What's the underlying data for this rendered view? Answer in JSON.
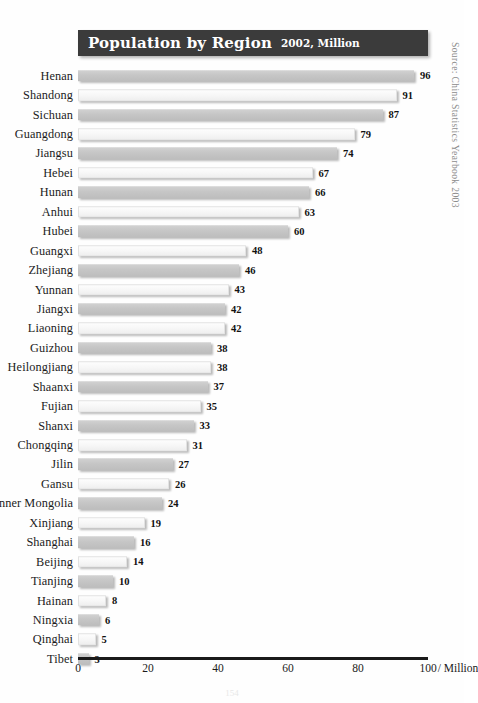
{
  "title": {
    "main": "Population by Region",
    "sub": "2002, Million"
  },
  "source_note": "Source: China Statistics Yearbook 2003",
  "page_number": "154",
  "axis": {
    "unit_label": "/ Million",
    "ticks": [
      "0",
      "20",
      "40",
      "60",
      "80",
      "100"
    ]
  },
  "chart_data": {
    "type": "bar",
    "orientation": "horizontal",
    "title": "Population by Region",
    "subtitle": "2002, Million",
    "xlabel": "/ Million",
    "ylabel": "",
    "xlim": [
      0,
      100
    ],
    "xticks": [
      0,
      20,
      40,
      60,
      80,
      100
    ],
    "grid": false,
    "legend": null,
    "source": "Source: China Statistics Yearbook 2003",
    "categories": [
      "Henan",
      "Shandong",
      "Sichuan",
      "Guangdong",
      "Jiangsu",
      "Hebei",
      "Hunan",
      "Anhui",
      "Hubei",
      "Guangxi",
      "Zhejiang",
      "Yunnan",
      "Jiangxi",
      "Liaoning",
      "Guizhou",
      "Heilongjiang",
      "Shaanxi",
      "Fujian",
      "Shanxi",
      "Chongqing",
      "Jilin",
      "Gansu",
      "Inner Mongolia",
      "Xinjiang",
      "Shanghai",
      "Beijing",
      "Tianjing",
      "Hainan",
      "Ningxia",
      "Qinghai",
      "Tibet"
    ],
    "values": [
      96,
      91,
      87,
      79,
      74,
      67,
      66,
      63,
      60,
      48,
      46,
      43,
      42,
      42,
      38,
      38,
      37,
      35,
      33,
      31,
      27,
      26,
      24,
      19,
      16,
      14,
      10,
      8,
      6,
      5,
      3
    ]
  },
  "colors": {
    "title_band": "#3b3b3b",
    "title_text": "#ffffff",
    "bar_gray": "#c6c6c6",
    "bar_white": "#f7f7f7",
    "axis": "#1a1a1a",
    "source_text": "#8c8c8c"
  }
}
